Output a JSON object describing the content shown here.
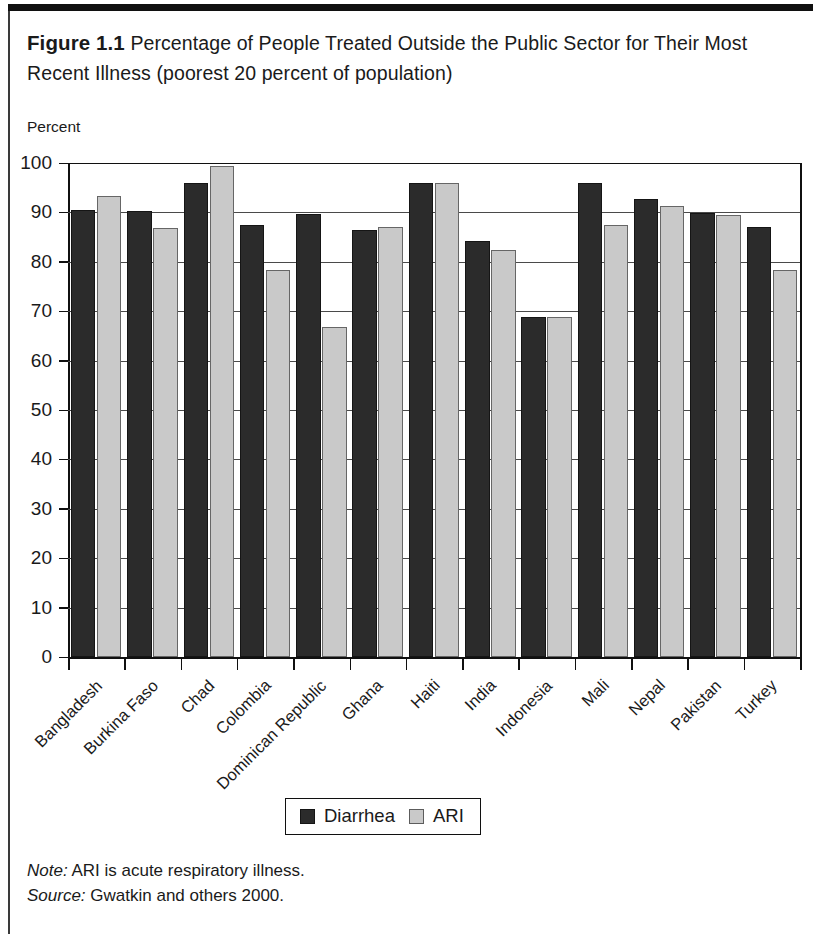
{
  "figure": {
    "number": "Figure 1.1",
    "title": "Percentage of People Treated Outside the Public Sector for Their Most Recent Illness (poorest 20 percent of population)"
  },
  "axis_unit_label": "Percent",
  "legend": {
    "items": [
      {
        "label": "Diarrhea",
        "swatch": "dark-square-swatch",
        "color": "#2b2b2b"
      },
      {
        "label": "ARI",
        "swatch": "light-square-swatch",
        "color": "#c9c9c9"
      }
    ]
  },
  "footnotes": [
    {
      "lead": "Note:",
      "text": " ARI is acute respiratory illness."
    },
    {
      "lead": "Source:",
      "text": " Gwatkin and others 2000."
    }
  ],
  "chart_data": {
    "type": "bar",
    "title": "Percentage of People Treated Outside the Public Sector for Their Most Recent Illness (poorest 20 percent of population)",
    "xlabel": "",
    "ylabel": "Percent",
    "ylim": [
      0,
      100
    ],
    "yticks": [
      0,
      10,
      20,
      30,
      40,
      50,
      60,
      70,
      80,
      90,
      100
    ],
    "ytick_labels": [
      "0",
      "10",
      "20",
      "30",
      "40",
      "50",
      "60",
      "70",
      "80",
      "90",
      "100"
    ],
    "grid": true,
    "legend_position": "bottom-center",
    "categories": [
      "Bangladesh",
      "Burkina Faso",
      "Chad",
      "Colombia",
      "Dominican Republic",
      "Ghana",
      "Haiti",
      "India",
      "Indonesia",
      "Mali",
      "Nepal",
      "Pakistan",
      "Turkey"
    ],
    "series": [
      {
        "name": "Diarrhea",
        "color": "#2b2b2b",
        "values": [
          90.5,
          90.2,
          96.0,
          87.5,
          89.7,
          86.4,
          95.9,
          84.2,
          68.8,
          96.0,
          92.7,
          89.9,
          87.0
        ]
      },
      {
        "name": "ARI",
        "color": "#c9c9c9",
        "values": [
          93.3,
          86.9,
          99.4,
          78.3,
          66.8,
          87.0,
          96.0,
          82.3,
          68.8,
          87.4,
          91.3,
          89.4,
          78.4
        ]
      }
    ]
  }
}
